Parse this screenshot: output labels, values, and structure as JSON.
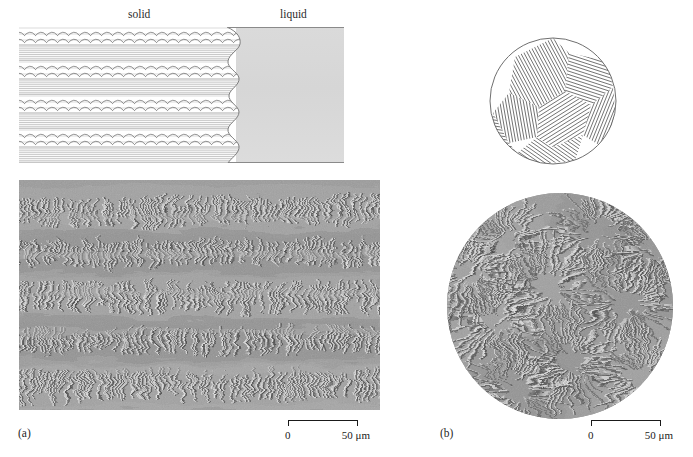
{
  "figure": {
    "panels": [
      {
        "id": "a",
        "label": "(a)",
        "schematic": {
          "region_labels": [
            {
              "name": "solid",
              "text": "solid"
            },
            {
              "name": "liquid",
              "text": "liquid"
            }
          ]
        },
        "scalebar": {
          "start_label": "0",
          "end_label": "50 μm"
        }
      },
      {
        "id": "b",
        "label": "(b)",
        "scalebar": {
          "start_label": "0",
          "end_label": "50 μm"
        }
      }
    ]
  },
  "colors": {
    "liquid_gray": "#d8d8d8",
    "line_gray": "#8a8a8a",
    "ink": "#1a1a1a",
    "micrograph_base": "#9b9b9b"
  }
}
